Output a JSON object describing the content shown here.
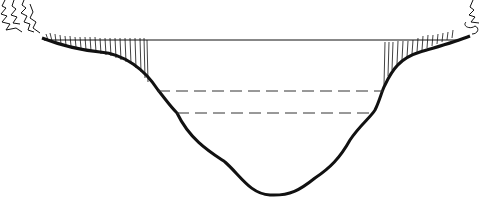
{
  "diagram": {
    "title": "",
    "colors": {
      "background": "#ffffff",
      "ink": "#111111",
      "dashed": "#333333"
    },
    "water_surface_y": 40,
    "dashed_levels": [
      {
        "y": 91,
        "x1": 158,
        "x2": 383
      },
      {
        "y": 113,
        "x1": 177,
        "x2": 372
      }
    ],
    "labels": []
  }
}
